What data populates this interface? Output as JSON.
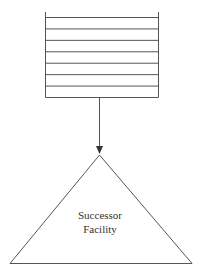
{
  "diagram": {
    "queue": {
      "name": "queue-stack",
      "line_count": 8
    },
    "arrow": {
      "name": "flow-arrow"
    },
    "facility": {
      "label_lines": [
        "Successor",
        "Facility"
      ]
    },
    "colors": {
      "stroke": "#555555",
      "text": "#333333",
      "background": "#ffffff"
    }
  }
}
